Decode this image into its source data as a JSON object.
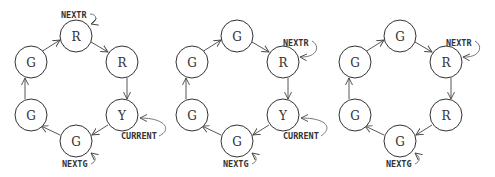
{
  "diagrams": [
    {
      "id": "diagram-1",
      "offset_x": 0,
      "nodes": [
        "R",
        "R",
        "Y",
        "G",
        "G",
        "G"
      ],
      "pointers": {
        "nextr": {
          "label": "NEXTR",
          "node": 0
        },
        "current": {
          "label": "CURRENT",
          "node": 2
        },
        "nextg": {
          "label": "NEXTG",
          "node": 3
        }
      }
    },
    {
      "id": "diagram-2",
      "offset_x": 161,
      "nodes": [
        "G",
        "R",
        "Y",
        "G",
        "G",
        "G"
      ],
      "pointers": {
        "nextr": {
          "label": "NEXTR",
          "node": 1
        },
        "current": {
          "label": "CURRENT",
          "node": 2
        },
        "nextg": {
          "label": "NEXTG",
          "node": 3
        }
      }
    },
    {
      "id": "diagram-3",
      "offset_x": 324,
      "nodes": [
        "G",
        "R",
        "R",
        "G",
        "G",
        "G"
      ],
      "pointers": {
        "nextr": {
          "label": "NEXTR",
          "node": 1
        },
        "nextg": {
          "label": "NEXTG",
          "node": 3
        }
      }
    }
  ],
  "colors": {
    "stroke": "#333333",
    "background": "#ffffff"
  }
}
